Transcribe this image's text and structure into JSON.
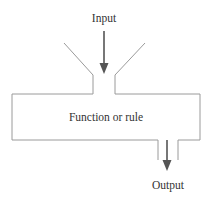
{
  "diagram": {
    "type": "function-machine",
    "input_label": "Input",
    "function_label": "Function or rule",
    "output_label": "Output",
    "colors": {
      "outline": "#9a9a9a",
      "arrow": "#555555",
      "text": "#333333",
      "background": "#ffffff"
    }
  }
}
